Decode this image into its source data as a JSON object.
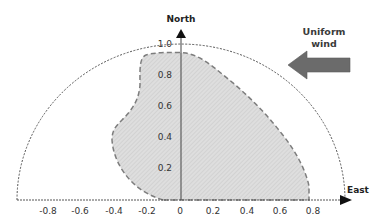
{
  "diagram": {
    "axes": {
      "north_label": "North",
      "east_label": "East",
      "origin_px": [
        181,
        200
      ],
      "unit_px_x": 165,
      "unit_px_y": 156,
      "x_ticks": [
        "-0.8",
        "-0.6",
        "-0.4",
        "-0.2",
        "0",
        "0.2",
        "0.4",
        "0.6",
        "0.8"
      ],
      "x_tick_values": [
        -0.8,
        -0.6,
        -0.4,
        -0.2,
        0,
        0.2,
        0.4,
        0.6,
        0.8
      ],
      "y_ticks": [
        "0.2",
        "0.4",
        "0.6",
        "0.8",
        "1.0"
      ],
      "y_tick_values": [
        0.2,
        0.4,
        0.6,
        0.8,
        1.0
      ]
    },
    "outer_boundary": {
      "shape": "half-ellipse",
      "radius": 1.0,
      "style": "dotted",
      "color": "#555555"
    },
    "shaded_region": {
      "fill": "#dcdcdc",
      "hatch": "#c4c4c4",
      "stroke": "#7a7a7a",
      "style": "dashed"
    },
    "wind": {
      "label_line1": "Uniform",
      "label_line2": "wind",
      "direction": "west",
      "color": "#6b6b6b"
    }
  }
}
